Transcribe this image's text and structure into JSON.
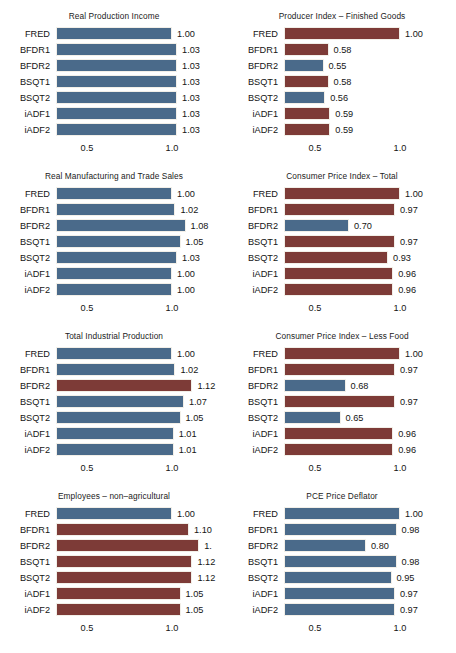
{
  "figure": {
    "axis_ticks": [
      "0.5",
      "1.0"
    ],
    "axis_tick_values": [
      0.5,
      1.0
    ],
    "colors": {
      "blue": "#4a6a8a",
      "red": "#7d3b37",
      "background": "#ffffff"
    }
  },
  "chart_data": [
    {
      "type": "bar",
      "title": "Real Production Income",
      "xlabel": "",
      "ylabel": "",
      "xlim": [
        0.38,
        1.15
      ],
      "grid": false,
      "legend": "none",
      "categories": [
        "FRED",
        "BFDR1",
        "BFDR2",
        "BSQT1",
        "BSQT2",
        "iADF1",
        "iADF2"
      ],
      "values": [
        1.0,
        1.03,
        1.03,
        1.03,
        1.03,
        1.03,
        1.03
      ],
      "labels": [
        "1.00",
        "1.03",
        "1.03",
        "1.03",
        "1.03",
        "1.03",
        "1.03"
      ],
      "colors": [
        "blue",
        "blue",
        "blue",
        "blue",
        "blue",
        "blue",
        "blue"
      ]
    },
    {
      "type": "bar",
      "title": "Producer Index – Finished Goods",
      "xlabel": "",
      "ylabel": "",
      "xlim": [
        0.38,
        1.15
      ],
      "grid": false,
      "legend": "none",
      "categories": [
        "FRED",
        "BFDR1",
        "BFDR2",
        "BSQT1",
        "BSQT2",
        "iADF1",
        "iADF2"
      ],
      "values": [
        1.0,
        0.58,
        0.55,
        0.58,
        0.56,
        0.59,
        0.59
      ],
      "labels": [
        "1.00",
        "0.58",
        "0.55",
        "0.58",
        "0.56",
        "0.59",
        "0.59"
      ],
      "colors": [
        "red",
        "red",
        "blue",
        "red",
        "blue",
        "red",
        "red"
      ]
    },
    {
      "type": "bar",
      "title": "Real Manufacturing and Trade Sales",
      "xlabel": "",
      "ylabel": "",
      "xlim": [
        0.38,
        1.15
      ],
      "grid": false,
      "legend": "none",
      "categories": [
        "FRED",
        "BFDR1",
        "BFDR2",
        "BSQT1",
        "BSQT2",
        "iADF1",
        "iADF2"
      ],
      "values": [
        1.0,
        1.02,
        1.08,
        1.05,
        1.03,
        1.0,
        1.0
      ],
      "labels": [
        "1.00",
        "1.02",
        "1.08",
        "1.05",
        "1.03",
        "1.00",
        "1.00"
      ],
      "colors": [
        "blue",
        "blue",
        "blue",
        "blue",
        "blue",
        "blue",
        "blue"
      ]
    },
    {
      "type": "bar",
      "title": "Consumer Price Index – Total",
      "xlabel": "",
      "ylabel": "",
      "xlim": [
        0.38,
        1.15
      ],
      "grid": false,
      "legend": "none",
      "categories": [
        "FRED",
        "BFDR1",
        "BFDR2",
        "BSQT1",
        "BSQT2",
        "iADF1",
        "iADF2"
      ],
      "values": [
        1.0,
        0.97,
        0.7,
        0.97,
        0.93,
        0.96,
        0.96
      ],
      "labels": [
        "1.00",
        "0.97",
        "0.70",
        "0.97",
        "0.93",
        "0.96",
        "0.96"
      ],
      "colors": [
        "red",
        "red",
        "blue",
        "red",
        "red",
        "red",
        "red"
      ]
    },
    {
      "type": "bar",
      "title": "Total Industrial Production",
      "xlabel": "",
      "ylabel": "",
      "xlim": [
        0.38,
        1.15
      ],
      "grid": false,
      "legend": "none",
      "categories": [
        "FRED",
        "BFDR1",
        "BFDR2",
        "BSQT1",
        "BSQT2",
        "iADF1",
        "iADF2"
      ],
      "values": [
        1.0,
        1.02,
        1.12,
        1.07,
        1.05,
        1.01,
        1.01
      ],
      "labels": [
        "1.00",
        "1.02",
        "1.12",
        "1.07",
        "1.05",
        "1.01",
        "1.01"
      ],
      "colors": [
        "blue",
        "blue",
        "red",
        "blue",
        "blue",
        "blue",
        "blue"
      ]
    },
    {
      "type": "bar",
      "title": "Consumer Price Index – Less Food",
      "xlabel": "",
      "ylabel": "",
      "xlim": [
        0.38,
        1.15
      ],
      "grid": false,
      "legend": "none",
      "categories": [
        "FRED",
        "BFDR1",
        "BFDR2",
        "BSQT1",
        "BSQT2",
        "iADF1",
        "iADF2"
      ],
      "values": [
        1.0,
        0.97,
        0.68,
        0.97,
        0.65,
        0.96,
        0.96
      ],
      "labels": [
        "1.00",
        "0.97",
        "0.68",
        "0.97",
        "0.65",
        "0.96",
        "0.96"
      ],
      "colors": [
        "red",
        "red",
        "blue",
        "red",
        "blue",
        "red",
        "red"
      ]
    },
    {
      "type": "bar",
      "title": "Employees – non–agricultural",
      "xlabel": "",
      "ylabel": "",
      "xlim": [
        0.38,
        1.15
      ],
      "grid": false,
      "legend": "none",
      "categories": [
        "FRED",
        "BFDR1",
        "BFDR2",
        "BSQT1",
        "BSQT2",
        "iADF1",
        "iADF2"
      ],
      "values": [
        1.0,
        1.1,
        1.16,
        1.12,
        1.12,
        1.05,
        1.05
      ],
      "labels": [
        "1.00",
        "1.10",
        "1.",
        "1.12",
        "1.12",
        "1.05",
        "1.05"
      ],
      "colors": [
        "blue",
        "red",
        "red",
        "red",
        "red",
        "red",
        "red"
      ]
    },
    {
      "type": "bar",
      "title": "PCE Price Deflator",
      "xlabel": "",
      "ylabel": "",
      "xlim": [
        0.38,
        1.15
      ],
      "grid": false,
      "legend": "none",
      "categories": [
        "FRED",
        "BFDR1",
        "BFDR2",
        "BSQT1",
        "BSQT2",
        "iADF1",
        "iADF2"
      ],
      "values": [
        1.0,
        0.98,
        0.8,
        0.98,
        0.95,
        0.97,
        0.97
      ],
      "labels": [
        "1.00",
        "0.98",
        "0.80",
        "0.98",
        "0.95",
        "0.97",
        "0.97"
      ],
      "colors": [
        "blue",
        "blue",
        "blue",
        "blue",
        "blue",
        "blue",
        "blue"
      ]
    }
  ]
}
